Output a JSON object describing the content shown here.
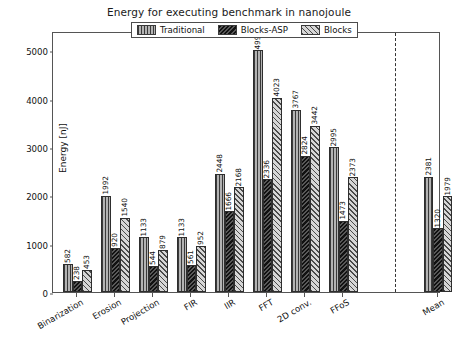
{
  "chart_data": {
    "type": "bar",
    "title": "Energy for executing benchmark in nanojoule",
    "xlabel": "",
    "ylabel": "Energy [nJ]",
    "ylim": [
      0,
      5400
    ],
    "yticks": [
      0,
      1000,
      2000,
      3000,
      4000,
      5000
    ],
    "grid": false,
    "legend_position": "top-center",
    "categories": [
      "Binarization",
      "Erosion",
      "Projection",
      "FIR",
      "IIR",
      "FFT",
      "2D conv.",
      "FFoS",
      "Mean"
    ],
    "series": [
      {
        "name": "Traditional",
        "pattern": "vertical-lines",
        "color": "#b3b3b3",
        "values": [
          582,
          1992,
          1133,
          1133,
          2448,
          4998,
          3767,
          2995,
          2381
        ]
      },
      {
        "name": "Blocks-ASP",
        "pattern": "dense-dark-hatch",
        "color": "#585858",
        "values": [
          238,
          920,
          544,
          561,
          1666,
          2336,
          2824,
          1473,
          1320
        ]
      },
      {
        "name": "Blocks",
        "pattern": "diagonal-hatch",
        "color": "#d6d6d6",
        "values": [
          453,
          1540,
          879,
          952,
          2168,
          4023,
          3442,
          2373,
          1979
        ]
      }
    ],
    "annotations": {
      "mean_divider": "dashed vertical line separating benchmark groups from Mean"
    }
  },
  "legend": {
    "entries": [
      {
        "label": "Traditional"
      },
      {
        "label": "Blocks-ASP"
      },
      {
        "label": "Blocks"
      }
    ]
  }
}
